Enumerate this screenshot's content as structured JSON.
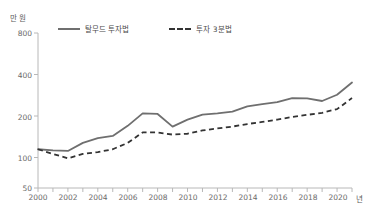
{
  "axes": {
    "y_unit": "만 원",
    "x_unit": "년",
    "y_ticks": [
      "800",
      "400",
      "200",
      "100",
      "50"
    ],
    "x_ticks": [
      "2000",
      "2002",
      "2004",
      "2006",
      "2008",
      "2010",
      "2012",
      "2014",
      "2016",
      "2018",
      "2020"
    ]
  },
  "legend": {
    "items": [
      {
        "label": "탈무드 투자법",
        "style": "solid",
        "color": "#6f6f6f"
      },
      {
        "label": "투자 3분법",
        "style": "dashed",
        "color": "#333333"
      }
    ]
  },
  "chart_data": {
    "type": "line",
    "title": "",
    "xlabel": "년",
    "ylabel": "만 원",
    "yscale": "log",
    "ylim": [
      50,
      800
    ],
    "xlim": [
      2000,
      2021
    ],
    "grid": false,
    "legend_position": "top-left",
    "x": [
      2000,
      2001,
      2002,
      2003,
      2004,
      2005,
      2006,
      2007,
      2008,
      2009,
      2010,
      2011,
      2012,
      2013,
      2014,
      2015,
      2016,
      2017,
      2018,
      2019,
      2020,
      2021
    ],
    "series": [
      {
        "name": "탈무드 투자법",
        "color": "#6f6f6f",
        "style": "solid",
        "values": [
          100,
          98,
          97,
          112,
          122,
          127,
          152,
          190,
          188,
          150,
          170,
          186,
          190,
          196,
          215,
          224,
          232,
          250,
          248,
          237,
          265,
          330
        ]
      },
      {
        "name": "투자 3분법",
        "color": "#333333",
        "style": "dashed",
        "values": [
          100,
          92,
          85,
          92,
          95,
          100,
          112,
          135,
          135,
          130,
          132,
          140,
          145,
          150,
          157,
          163,
          170,
          178,
          185,
          192,
          205,
          250
        ]
      }
    ]
  }
}
